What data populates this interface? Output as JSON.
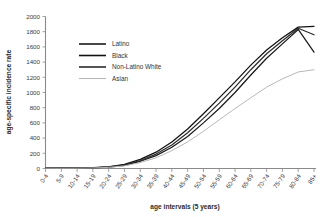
{
  "chart_data": {
    "type": "line",
    "title": "",
    "xlabel": "age intervals (5 years)",
    "ylabel": "age-specific incidence rate",
    "grid": false,
    "legend_position": "upper-left-inside",
    "categories": [
      "0-4",
      "5-9",
      "10-14",
      "15-19",
      "20-24",
      "25-29",
      "30-34",
      "35-39",
      "40-44",
      "45-49",
      "50-54",
      "55-59",
      "60-64",
      "65-69",
      "70-74",
      "75-79",
      "80-84",
      "85+"
    ],
    "ylim": [
      0,
      2000
    ],
    "yticks": [
      0,
      200,
      400,
      600,
      800,
      1000,
      1200,
      1400,
      1600,
      1800,
      2000
    ],
    "ytick_labels": [
      "0",
      "200",
      "400",
      "600",
      "800",
      "1000",
      "1200",
      "1400",
      "1600",
      "1800",
      "2000"
    ],
    "series": [
      {
        "name": "Latino",
        "color": "#1a1a1a",
        "values": [
          5,
          4,
          5,
          8,
          18,
          42,
          95,
          170,
          280,
          420,
          600,
          790,
          1000,
          1230,
          1450,
          1640,
          1830,
          1530
        ]
      },
      {
        "name": "Black",
        "color": "#111111",
        "values": [
          5,
          4,
          6,
          10,
          22,
          55,
          120,
          215,
          350,
          520,
          720,
          930,
          1140,
          1360,
          1560,
          1720,
          1860,
          1870
        ]
      },
      {
        "name": "Non-Latino White",
        "color": "#2b2b2b",
        "values": [
          5,
          4,
          5,
          9,
          20,
          48,
          105,
          190,
          310,
          470,
          660,
          860,
          1070,
          1300,
          1510,
          1680,
          1845,
          1760
        ]
      },
      {
        "name": "Asian",
        "color": "#b8b8b8",
        "values": [
          4,
          3,
          4,
          7,
          15,
          35,
          78,
          140,
          235,
          350,
          490,
          640,
          790,
          930,
          1070,
          1180,
          1270,
          1300
        ]
      }
    ]
  },
  "legend": {
    "items": [
      {
        "label": "Latino"
      },
      {
        "label": "Black"
      },
      {
        "label": "Non-Latino White"
      },
      {
        "label": "Asian"
      }
    ]
  },
  "axes": {
    "y_title": "age-specific incidence rate",
    "x_title": "age intervals (5 years)"
  }
}
